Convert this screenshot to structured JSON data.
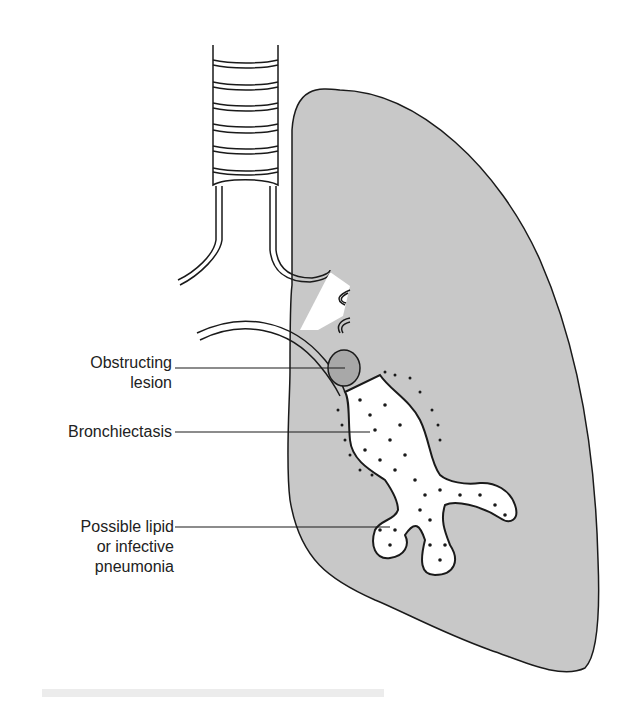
{
  "figure": {
    "colors": {
      "lung_fill": "#c8c8c8",
      "lesion_fill": "#a8a8a8",
      "outline": "#1a1a1a",
      "airway_fill": "#ffffff"
    },
    "labels": [
      {
        "id": "obstructing-lesion",
        "lines": [
          "Obstructing",
          "lesion"
        ]
      },
      {
        "id": "bronchiectasis",
        "lines": [
          "Bronchiectasis"
        ]
      },
      {
        "id": "pneumonia",
        "lines": [
          "Possible lipid",
          "or infective",
          "pneumonia"
        ]
      }
    ]
  }
}
